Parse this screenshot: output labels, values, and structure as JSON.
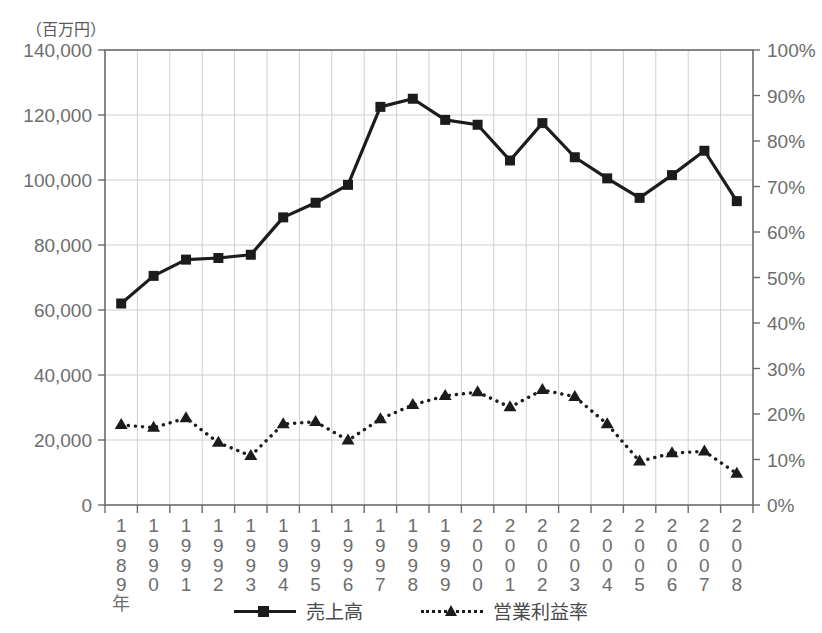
{
  "chart_data": {
    "type": "line",
    "title": "",
    "unit_label": "（百万円）",
    "xlabel": "",
    "x_axis_suffix": "年",
    "categories": [
      "1989",
      "1990",
      "1991",
      "1992",
      "1993",
      "1994",
      "1995",
      "1996",
      "1997",
      "1998",
      "1999",
      "2000",
      "2001",
      "2002",
      "2003",
      "2004",
      "2005",
      "2006",
      "2007",
      "2008"
    ],
    "ylabel": "",
    "ylim": [
      0,
      140000
    ],
    "yticks": [
      "0",
      "20,000",
      "40,000",
      "60,000",
      "80,000",
      "100,000",
      "120,000",
      "140,000"
    ],
    "ytick_values": [
      0,
      20000,
      40000,
      60000,
      80000,
      100000,
      120000,
      140000
    ],
    "y2label": "",
    "y2lim": [
      0,
      100
    ],
    "y2ticks": [
      "0%",
      "10%",
      "20%",
      "30%",
      "40%",
      "50%",
      "60%",
      "70%",
      "80%",
      "90%",
      "100%"
    ],
    "y2tick_values": [
      0,
      10,
      20,
      30,
      40,
      50,
      60,
      70,
      80,
      90,
      100
    ],
    "grid": true,
    "legend_position": "bottom",
    "series": [
      {
        "name": "売上高",
        "axis": "left",
        "marker": "square",
        "linestyle": "solid",
        "color": "#1c1c1c",
        "values": [
          62000,
          70500,
          75500,
          76000,
          77000,
          88500,
          93000,
          98500,
          122500,
          125000,
          118500,
          117000,
          106000,
          117500,
          107000,
          100500,
          94500,
          101500,
          109000,
          93500
        ]
      },
      {
        "name": "営業利益率",
        "axis": "right",
        "marker": "triangle",
        "linestyle": "dotted",
        "color": "#1c1c1c",
        "values": [
          17.6,
          17.0,
          19.1,
          13.7,
          10.8,
          17.8,
          18.3,
          14.2,
          18.9,
          22.0,
          24.0,
          24.8,
          21.5,
          25.3,
          23.8,
          17.8,
          9.6,
          11.4,
          11.8,
          6.9
        ]
      }
    ]
  },
  "legend": {
    "items": [
      {
        "label": "売上高",
        "marker": "square",
        "linestyle": "solid"
      },
      {
        "label": "営業利益率",
        "marker": "triangle",
        "linestyle": "dotted"
      }
    ]
  },
  "colors": {
    "line": "#1c1c1c",
    "grid": "#cfcfcf",
    "axis": "#6b6b6b",
    "text": "#6d6d6d"
  }
}
